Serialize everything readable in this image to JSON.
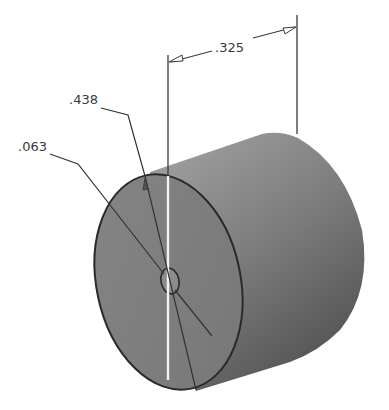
{
  "figure": {
    "colors": {
      "background": "#ffffff",
      "body_light": "#9a9a9a",
      "body_dark": "#5e5e5e",
      "front_face": "#7f7f7f",
      "outline": "#2a2a2a",
      "dimension_line": "#3a3a3a",
      "centerline": "#f2f2f2"
    }
  },
  "dimensions": {
    "length": {
      "label": ".325"
    },
    "outer_diameter": {
      "label": ".438"
    },
    "hole_diameter": {
      "label": ".063"
    }
  }
}
